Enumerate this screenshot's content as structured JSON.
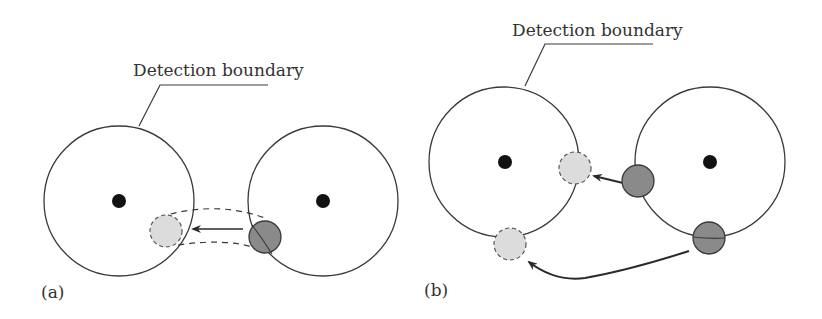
{
  "panels": [
    {
      "id": "a",
      "label": "(a)",
      "boundary_label": "Detection boundary"
    },
    {
      "id": "b",
      "label": "(b)",
      "boundary_label": "Detection boundary"
    }
  ],
  "colors": {
    "stroke": "#3a3a3a",
    "node_dot": "#111111",
    "light_fill": "#dcdcdc",
    "dark_fill": "#8a8a8a"
  }
}
